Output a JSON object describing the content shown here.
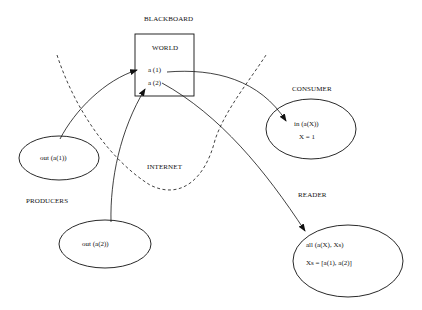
{
  "labels": {
    "blackboard": "BLACKBOARD",
    "world": "WORLD",
    "consumer": "CONSUMER",
    "producers": "PRODUCERS",
    "internet": "INTERNET",
    "reader": "READER"
  },
  "world_tuples": [
    "a (1)",
    "a (2)"
  ],
  "producer1": {
    "op": "out (a(1))"
  },
  "producer2": {
    "op": "out (a(2))"
  },
  "consumer": {
    "op": "in (a(X))",
    "result": "X = 1"
  },
  "reader": {
    "op": "all (a(X), Xs)",
    "result": "Xs = [a(1), a(2)]"
  }
}
